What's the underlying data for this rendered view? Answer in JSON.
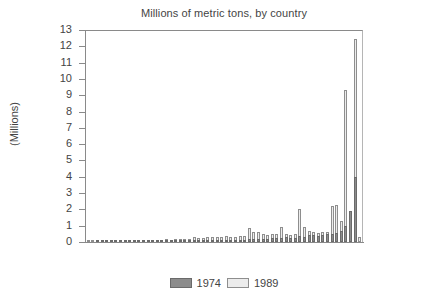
{
  "chart_data": {
    "type": "bar",
    "title": "Millions of metric tons, by country",
    "xlabel": "",
    "ylabel": "(Millions)",
    "ylim": [
      0,
      13
    ],
    "ytick_labels": [
      "13",
      "12",
      "11",
      "10",
      "9",
      "8",
      "7",
      "6",
      "5",
      "4",
      "3",
      "2",
      "1",
      "0"
    ],
    "ytick_values": [
      13,
      12,
      11,
      10,
      9,
      8,
      7,
      6,
      5,
      4,
      3,
      2,
      1,
      0
    ],
    "grid": false,
    "legend_position": "bottom-center",
    "x_tick_labels_shown": false,
    "categories": [
      "C1",
      "C2",
      "C3",
      "C4",
      "C5",
      "C6",
      "C7",
      "C8",
      "C9",
      "C10",
      "C11",
      "C12",
      "C13",
      "C14",
      "C15",
      "C16",
      "C17",
      "C18",
      "C19",
      "C20",
      "C21",
      "C22",
      "C23",
      "C24",
      "C25",
      "C26",
      "C27",
      "C28",
      "C29",
      "C30",
      "C31",
      "C32",
      "C33",
      "C34",
      "C35",
      "C36",
      "C37",
      "C38",
      "C39",
      "C40",
      "C41",
      "C42",
      "C43",
      "C44",
      "C45",
      "C46",
      "C47",
      "C48",
      "C49",
      "C50",
      "C51",
      "C52",
      "C53",
      "C54",
      "C55",
      "C56",
      "C57",
      "C58",
      "C59",
      "C60"
    ],
    "series": [
      {
        "name": "1974",
        "color": "#8c8c8c",
        "values": [
          0.0,
          0.0,
          0.02,
          0.04,
          0.03,
          0.02,
          0.02,
          0.03,
          0.03,
          0.06,
          0.06,
          0.05,
          0.06,
          0.06,
          0.05,
          0.06,
          0.07,
          0.06,
          0.07,
          0.08,
          0.07,
          0.06,
          0.09,
          0.1,
          0.09,
          0.08,
          0.1,
          0.12,
          0.1,
          0.1,
          0.12,
          0.13,
          0.12,
          0.14,
          0.13,
          0.18,
          0.16,
          0.17,
          0.2,
          0.18,
          0.22,
          0.24,
          0.26,
          0.28,
          0.26,
          0.24,
          0.4,
          0.3,
          0.42,
          0.44,
          0.38,
          0.46,
          0.48,
          0.52,
          0.55,
          0.7,
          1.0,
          1.92,
          4.0,
          0.0
        ]
      },
      {
        "name": "1989",
        "color": "#ececec",
        "values": [
          0.04,
          0.05,
          0.06,
          0.07,
          0.06,
          0.07,
          0.08,
          0.08,
          0.1,
          0.1,
          0.11,
          0.1,
          0.12,
          0.12,
          0.13,
          0.14,
          0.14,
          0.16,
          0.15,
          0.17,
          0.18,
          0.18,
          0.2,
          0.3,
          0.26,
          0.24,
          0.32,
          0.3,
          0.28,
          0.3,
          0.34,
          0.32,
          0.3,
          0.38,
          0.36,
          0.86,
          0.62,
          0.6,
          0.5,
          0.44,
          0.52,
          0.48,
          0.9,
          0.5,
          0.44,
          0.5,
          2.04,
          0.92,
          0.68,
          0.62,
          0.56,
          0.6,
          0.64,
          2.22,
          2.26,
          1.3,
          9.36,
          0.9,
          12.52,
          0.3
        ]
      }
    ],
    "legend": [
      {
        "label": "1974",
        "swatch": "dark-gray"
      },
      {
        "label": "1989",
        "swatch": "light-gray"
      }
    ]
  }
}
